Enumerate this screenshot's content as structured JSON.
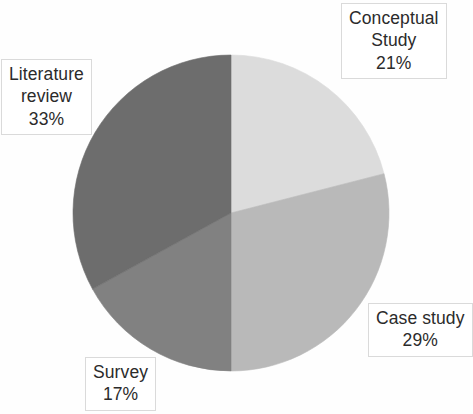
{
  "chart_data": {
    "type": "pie",
    "title": "",
    "categories": [
      "Conceptual Study",
      "Case study",
      "Survey",
      "Literature review"
    ],
    "values": [
      21,
      29,
      17,
      33
    ],
    "value_unit": "%",
    "labels": [
      {
        "name": "Conceptual Study",
        "name_line1": "Conceptual",
        "name_line2": "Study",
        "value": "21%",
        "color": "#dcdcdc",
        "start_angle_deg": 0,
        "end_angle_deg": 75.6
      },
      {
        "name": "Case study",
        "name_line1": "Case study",
        "name_line2": "",
        "value": "29%",
        "color": "#b9b9b9",
        "start_angle_deg": 75.6,
        "end_angle_deg": 180
      },
      {
        "name": "Survey",
        "name_line1": "Survey",
        "name_line2": "",
        "value": "17%",
        "color": "#818181",
        "start_angle_deg": 180,
        "end_angle_deg": 241.2
      },
      {
        "name": "Literature review",
        "name_line1": "Literature",
        "name_line2": "review",
        "value": "33%",
        "color": "#6d6d6d",
        "start_angle_deg": 241.2,
        "end_angle_deg": 360
      }
    ],
    "legend_position": "data-labels",
    "grid": false,
    "background_color": "#ffffff",
    "geometry": {
      "center_x": 231,
      "center_y": 213,
      "radius": 158
    }
  },
  "labels": {
    "conceptual": {
      "line1": "Conceptual",
      "line2": "Study",
      "value": "21%"
    },
    "literature": {
      "line1": "Literature",
      "line2": "review",
      "value": "33%"
    },
    "case": {
      "line1": "Case study",
      "value": "29%"
    },
    "survey": {
      "line1": "Survey",
      "value": "17%"
    }
  }
}
